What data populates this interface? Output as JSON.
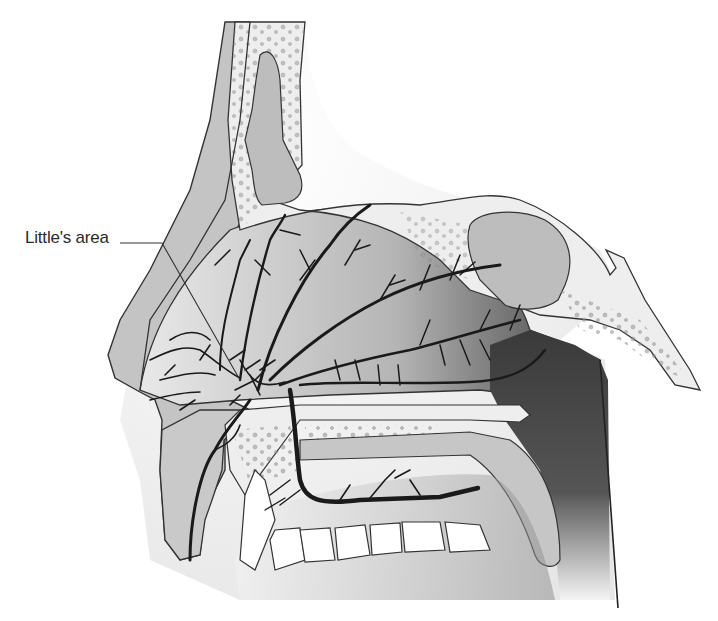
{
  "figure": {
    "labels": [
      {
        "text": "Little's area",
        "target": "anastomotic plexus on anterior nasal septum"
      }
    ]
  },
  "colors": {
    "background": "#ffffff",
    "soft_tissue": "#c9c9c9",
    "bone": "#eeeeee",
    "sinus": "#bdbdbd",
    "dark_cavity": "#4a4a4a",
    "vessel": "#1a1a1a",
    "outline": "#333333"
  }
}
